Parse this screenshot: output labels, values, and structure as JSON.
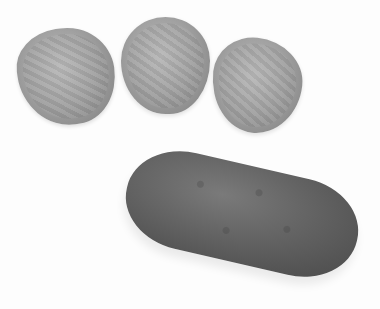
{
  "image": {
    "description": "Grayscale photograph of three pickle slices above one whole pickle on a white background",
    "colors": {
      "background": "#fdfdfd",
      "slice": "#a2a2a2",
      "pickle": "#5e5e5e"
    },
    "objects": [
      {
        "name": "pickle-slice",
        "count": 3
      },
      {
        "name": "whole-pickle",
        "count": 1
      }
    ]
  }
}
